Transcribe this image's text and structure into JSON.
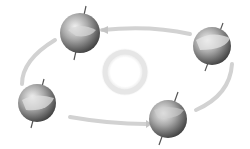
{
  "diagram": {
    "type": "earth-orbit-seasons",
    "center": {
      "name": "sun",
      "x": 125,
      "y": 72,
      "r": 22
    },
    "globes": [
      {
        "name": "globe-top",
        "x": 80,
        "y": 33,
        "r": 20
      },
      {
        "name": "globe-right",
        "x": 212,
        "y": 46,
        "r": 19
      },
      {
        "name": "globe-left",
        "x": 37,
        "y": 103,
        "r": 19
      },
      {
        "name": "globe-bottom-right",
        "x": 168,
        "y": 119,
        "r": 19
      }
    ],
    "colors": {
      "orbit": "#cfcfcf",
      "globe_dark": "#4a4a4a",
      "globe_light": "#e6e6e6",
      "sun_ring": "#e2e2e2"
    }
  }
}
